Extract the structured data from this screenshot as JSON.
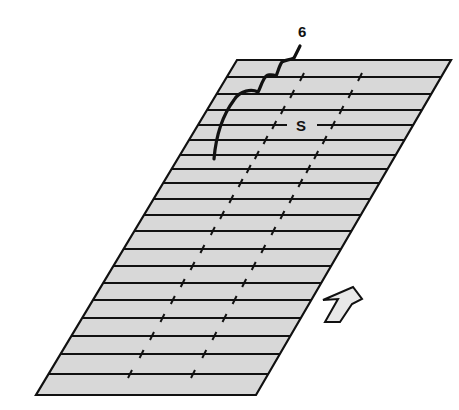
{
  "diagram": {
    "type": "parallelogram-strip-field",
    "colors": {
      "fill": "#d8d8d8",
      "stroke": "#111111",
      "background": "#ffffff",
      "arrow_fill": "#e8e8e8"
    },
    "outline": {
      "top_left": [
        237,
        60
      ],
      "top_right": [
        451,
        60
      ],
      "bottom_right": [
        256,
        395
      ],
      "bottom_left": [
        36,
        395
      ]
    },
    "row_lines_y": [
      77,
      94,
      110,
      125,
      140,
      155,
      169,
      183,
      199,
      215,
      231,
      249,
      266,
      283,
      300,
      318,
      336,
      354,
      374
    ],
    "tick_columns": [
      {
        "name": "column-1",
        "top": [
          302,
          77
        ],
        "bottom": [
          130,
          374
        ]
      },
      {
        "name": "column-2",
        "top": [
          360,
          77
        ],
        "bottom": [
          193,
          374
        ]
      }
    ],
    "labels": {
      "six": {
        "text": "6",
        "x": 298,
        "y": 24
      },
      "s": {
        "text": "S",
        "x": 296,
        "y": 118
      }
    },
    "arrow": {
      "icon": "up-right-arrow-icon",
      "points": "323,300 338,299 325,322 340,322 352,304 362,299 353,287"
    }
  }
}
